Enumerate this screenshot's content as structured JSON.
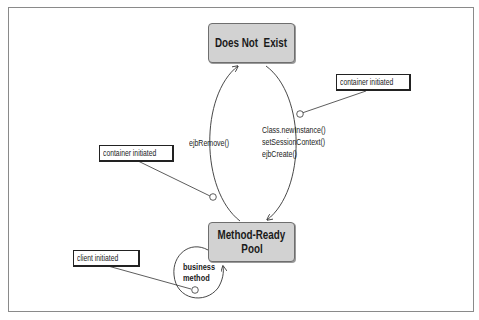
{
  "diagram": {
    "type": "state-diagram",
    "states": [
      {
        "id": "does-not-exist",
        "label": "Does Not  Exist"
      },
      {
        "id": "method-ready-pool",
        "label_line1": "Method-Ready",
        "label_line2": "Pool"
      }
    ],
    "transitions": [
      {
        "from": "method-ready-pool",
        "to": "does-not-exist",
        "label": "ejbRemove()"
      },
      {
        "from": "does-not-exist",
        "to": "method-ready-pool",
        "label_lines": [
          "Class.newInstance()",
          "setSessionContext()",
          "ejbCreate()"
        ]
      },
      {
        "from": "method-ready-pool",
        "to": "method-ready-pool",
        "label_line1": "business",
        "label_line2": "method"
      }
    ],
    "notes": [
      {
        "id": "note-create",
        "text": "container initiated"
      },
      {
        "id": "note-remove",
        "text": "container initiated"
      },
      {
        "id": "note-business",
        "text": "client initiated"
      }
    ],
    "colors": {
      "state_fill": "#d2d2d2",
      "state_border": "#6e6e6e",
      "line": "#333333"
    }
  }
}
